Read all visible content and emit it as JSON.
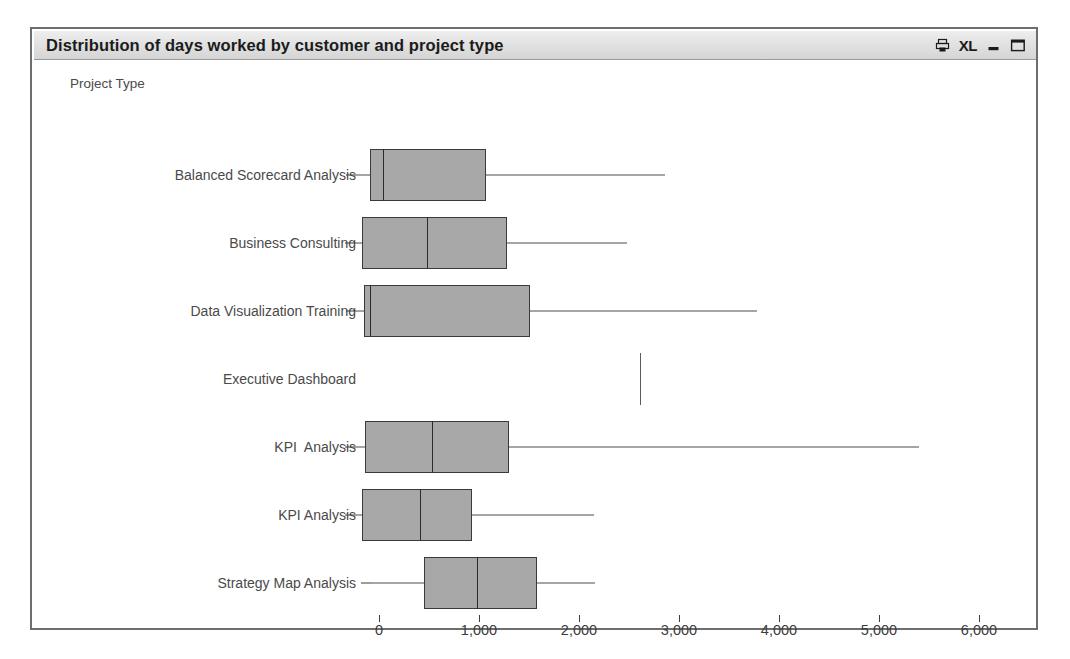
{
  "window": {
    "title": "Distribution of days worked by customer and project type",
    "controls": [
      {
        "name": "print-icon",
        "label": "Ὓ6",
        "kind": "print"
      },
      {
        "name": "excel-export-icon",
        "label": "XL",
        "kind": "xl"
      },
      {
        "name": "minimize-button",
        "label": "—",
        "kind": "minimize"
      },
      {
        "name": "maximize-button",
        "label": "□",
        "kind": "maximize"
      }
    ],
    "border_color": "#6e6e6e",
    "titlebar_color": "#e2e2e2"
  },
  "chart_data": {
    "type": "boxplot",
    "orientation": "horizontal",
    "title": "Distribution of days worked by customer and project type",
    "axis_caption": "Project Type",
    "ylabel": "Project Type",
    "xlabel": "",
    "xlim": [
      -250,
      6300
    ],
    "xticks": [
      0,
      1000,
      2000,
      3000,
      4000,
      5000,
      6000
    ],
    "xticklabels": [
      "0",
      "1,000",
      "2,000",
      "3,000",
      "4,000",
      "5,000",
      "6,000"
    ],
    "grid": false,
    "legend": false,
    "box_fill": "#a8a8a8",
    "box_edge": "#3a3a3a",
    "categories": [
      "Balanced Scorecard Analysis",
      "Business Consulting",
      "Data Visualization Training",
      "Executive Dashboard",
      "KPI  Analysis",
      "KPI Analysis",
      "Strategy Map Analysis"
    ],
    "boxes": [
      {
        "category": "Balanced Scorecard Analysis",
        "whisker_low": -220,
        "q1": -90,
        "median": 40,
        "q3": 1070,
        "whisker_high": 2860,
        "single_value": null
      },
      {
        "category": "Business Consulting",
        "whisker_low": -230,
        "q1": -170,
        "median": 480,
        "q3": 1280,
        "whisker_high": 2480,
        "single_value": null
      },
      {
        "category": "Data Visualization Training",
        "whisker_low": -225,
        "q1": -150,
        "median": -90,
        "q3": 1510,
        "whisker_high": 3780,
        "single_value": null
      },
      {
        "category": "Executive Dashboard",
        "whisker_low": null,
        "q1": null,
        "median": null,
        "q3": null,
        "whisker_high": null,
        "single_value": 2610
      },
      {
        "category": "KPI  Analysis",
        "whisker_low": -230,
        "q1": -140,
        "median": 530,
        "q3": 1300,
        "whisker_high": 5400,
        "single_value": null
      },
      {
        "category": "KPI Analysis",
        "whisker_low": -230,
        "q1": -170,
        "median": 410,
        "q3": 930,
        "whisker_high": 2150,
        "single_value": null
      },
      {
        "category": "Strategy Map Analysis",
        "whisker_low": -70,
        "q1": 450,
        "median": 980,
        "q3": 1580,
        "whisker_high": 2160,
        "single_value": null
      }
    ]
  }
}
